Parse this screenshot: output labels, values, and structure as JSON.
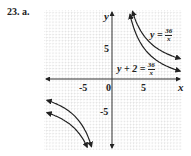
{
  "problem_label": "23. a.",
  "chart_data": {
    "type": "line",
    "title": "",
    "xlabel": "x",
    "ylabel": "y",
    "xlim": [
      -11,
      11
    ],
    "ylim": [
      -11,
      11
    ],
    "grid": true,
    "x_ticks": [
      -5,
      0,
      5
    ],
    "y_ticks": [
      -5,
      5
    ],
    "series": [
      {
        "name": "y = 36/x",
        "equation": "y=36/x",
        "branches": "both"
      },
      {
        "name": "y + 2 = 36/x",
        "equation": "y=36/x-2",
        "branches": "both"
      }
    ],
    "annotations": [
      {
        "text": "y = 36/x",
        "x": 6.5,
        "y": 8
      },
      {
        "text": "y + 2 = 36/x",
        "x": 4,
        "y": 1.5
      }
    ]
  },
  "ticks": {
    "xneg": "-5",
    "xzero": "0",
    "xpos": "5",
    "ypos": "5",
    "yneg": "-5"
  },
  "axis": {
    "x": "x",
    "y": "y"
  },
  "eq1": {
    "lhs": "y =",
    "num": "36",
    "den": "x"
  },
  "eq2": {
    "lhs": "y + 2 =",
    "num": "36",
    "den": "x"
  }
}
